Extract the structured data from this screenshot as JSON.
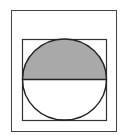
{
  "diagram": {
    "outer_rect": {
      "x": 11,
      "y": 10,
      "w": 105,
      "h": 121
    },
    "inner_square": {
      "x": 22,
      "y": 39,
      "w": 84,
      "h": 81
    },
    "circle": {
      "cx": 64,
      "cy": 79.5,
      "rx": 42,
      "ry": 40.5
    },
    "diameter_y": 79.5,
    "colors": {
      "stroke": "#333333",
      "shade": "#a9a9a9",
      "background": "#ffffff"
    }
  }
}
